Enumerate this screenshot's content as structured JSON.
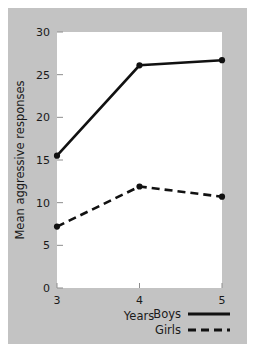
{
  "chart_data": {
    "type": "line",
    "title": "",
    "xlabel": "Years",
    "ylabel": "Mean aggressive responses",
    "x": [
      3,
      4,
      5
    ],
    "xticklabels": [
      "3",
      "4",
      "5"
    ],
    "xlim": [
      3,
      5
    ],
    "ylim": [
      0,
      30
    ],
    "yticks": [
      0,
      5,
      10,
      15,
      20,
      25,
      30
    ],
    "yticklabels": [
      "0",
      "5",
      "10",
      "15",
      "20",
      "25",
      "30"
    ],
    "grid": false,
    "legend_position": "below-right",
    "series": [
      {
        "name": "Boys",
        "values": [
          15.5,
          26.1,
          26.7
        ],
        "linestyle": "solid",
        "marker": "circle",
        "color": "#111111"
      },
      {
        "name": "Girls",
        "values": [
          7.2,
          11.9,
          10.7
        ],
        "linestyle": "dashed",
        "marker": "circle",
        "color": "#111111"
      }
    ]
  },
  "figure": {
    "background_color": "#c3c3c3",
    "plot_background_color": "#ffffff",
    "page_background_color": "#ffffff"
  },
  "ticks": {
    "y": [
      {
        "label": "30",
        "value": 30
      },
      {
        "label": "25",
        "value": 25
      },
      {
        "label": "20",
        "value": 20
      },
      {
        "label": "15",
        "value": 15
      },
      {
        "label": "10",
        "value": 10
      },
      {
        "label": "5",
        "value": 5
      },
      {
        "label": "0",
        "value": 0
      }
    ],
    "x": [
      {
        "label": "3",
        "value": 3
      },
      {
        "label": "4",
        "value": 4
      },
      {
        "label": "5",
        "value": 5
      }
    ]
  },
  "legend": {
    "entries": [
      {
        "label": "Boys",
        "linestyle": "solid"
      },
      {
        "label": "Girls",
        "linestyle": "dashed"
      }
    ]
  }
}
